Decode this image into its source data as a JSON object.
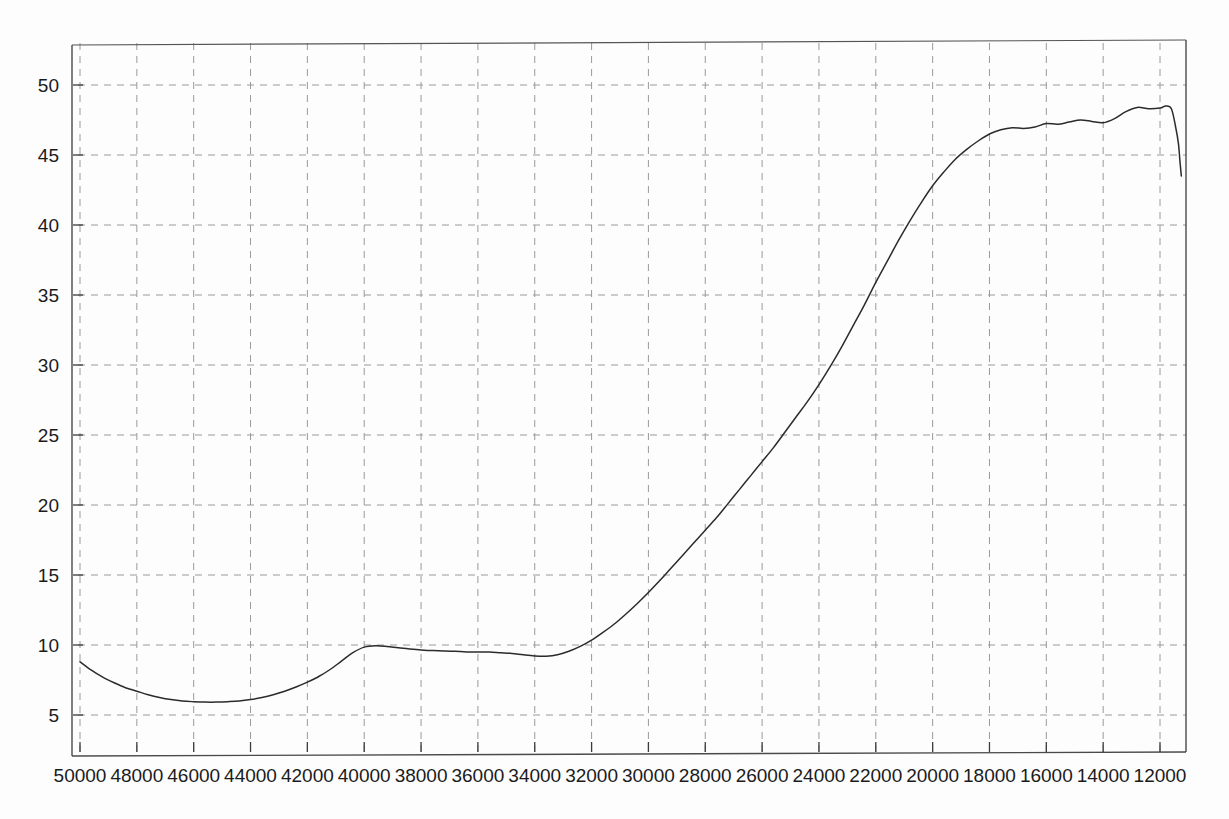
{
  "chart_data": {
    "type": "line",
    "title": "",
    "subtitle": "",
    "xlabel": "",
    "ylabel": "",
    "grid": true,
    "legend": null,
    "x_axis_reversed": true,
    "xlim": [
      50000,
      11200
    ],
    "ylim": [
      2.1,
      52.5
    ],
    "x_ticks": [
      50000,
      48000,
      46000,
      44000,
      42000,
      40000,
      38000,
      36000,
      34000,
      32000,
      30000,
      28000,
      26000,
      24000,
      22000,
      20000,
      18000,
      16000,
      14000,
      12000
    ],
    "x_tick_labels": [
      "50000",
      "48000",
      "46000",
      "44000",
      "42000",
      "40000",
      "38000",
      "36000",
      "34000",
      "32000",
      "30000",
      "28000",
      "26000",
      "24000",
      "22000",
      "20000",
      "18000",
      "16000",
      "14000",
      "12000"
    ],
    "y_ticks": [
      5,
      10,
      15,
      20,
      25,
      30,
      35,
      40,
      45,
      50
    ],
    "y_tick_labels": [
      "5",
      "10",
      "15",
      "20",
      "25",
      "30",
      "35",
      "40",
      "45",
      "50"
    ],
    "series": [
      {
        "name": "trace",
        "color": "#2b2b2b",
        "x": [
          50000,
          49600,
          49200,
          48800,
          48400,
          48000,
          47600,
          47200,
          46800,
          46400,
          46000,
          45600,
          45200,
          44800,
          44400,
          44000,
          43600,
          43200,
          42800,
          42400,
          42000,
          41600,
          41200,
          40800,
          40400,
          40000,
          39600,
          39200,
          38800,
          38400,
          38000,
          37600,
          37200,
          36800,
          36400,
          36000,
          35600,
          35200,
          34800,
          34400,
          34000,
          33600,
          33200,
          32800,
          32400,
          32000,
          31600,
          31200,
          30800,
          30400,
          30000,
          29600,
          29200,
          28800,
          28400,
          28000,
          27600,
          27200,
          26800,
          26400,
          26000,
          25600,
          25200,
          24800,
          24400,
          24000,
          23600,
          23200,
          22800,
          22400,
          22000,
          21600,
          21200,
          20800,
          20400,
          20000,
          19600,
          19200,
          18800,
          18400,
          18000,
          17600,
          17200,
          16800,
          16400,
          16000,
          15600,
          15200,
          14800,
          14400,
          14000,
          13600,
          13200,
          12800,
          12400,
          12000,
          11800,
          11600,
          11450,
          11350,
          11300,
          11250
        ],
        "y": [
          8.8,
          8.2,
          7.7,
          7.3,
          6.95,
          6.7,
          6.45,
          6.25,
          6.1,
          6.0,
          5.95,
          5.92,
          5.92,
          5.95,
          6.0,
          6.1,
          6.25,
          6.45,
          6.7,
          7.0,
          7.35,
          7.75,
          8.25,
          8.85,
          9.45,
          9.85,
          9.95,
          9.9,
          9.8,
          9.72,
          9.65,
          9.6,
          9.58,
          9.55,
          9.5,
          9.5,
          9.5,
          9.45,
          9.4,
          9.3,
          9.22,
          9.2,
          9.3,
          9.55,
          9.9,
          10.35,
          10.9,
          11.5,
          12.2,
          12.95,
          13.75,
          14.6,
          15.5,
          16.4,
          17.3,
          18.2,
          19.1,
          20.1,
          21.1,
          22.1,
          23.1,
          24.1,
          25.2,
          26.3,
          27.4,
          28.6,
          29.9,
          31.3,
          32.8,
          34.3,
          35.9,
          37.4,
          38.9,
          40.3,
          41.6,
          42.8,
          43.8,
          44.7,
          45.4,
          46.0,
          46.5,
          46.8,
          46.95,
          46.9,
          47.0,
          47.25,
          47.2,
          47.35,
          47.5,
          47.4,
          47.3,
          47.6,
          48.1,
          48.4,
          48.3,
          48.35,
          48.5,
          48.3,
          47.0,
          45.8,
          44.6,
          43.5
        ]
      }
    ],
    "annotations": []
  },
  "figure": {
    "background_color": "#fdfdfd",
    "axis_color": "#4a4a4a",
    "grid_color": "#9a9a9a",
    "line_color": "#2b2b2b",
    "label_color": "#1b1b1b"
  }
}
